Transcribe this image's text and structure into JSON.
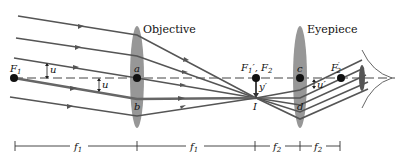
{
  "diagram": {
    "labels": {
      "objective": "Objective",
      "eyepiece": "Eyepiece",
      "F1": "F",
      "F1_sub": "1",
      "a": "a",
      "b": "b",
      "u_top": "u",
      "u_bottom": "u",
      "F1prime_F2": "F",
      "F1prime_sub": "1",
      "F1prime_comma": "′, F",
      "F2_sub": "2",
      "y_prime": "y′",
      "I": "I",
      "c": "c",
      "d": "d",
      "u_prime": "u′",
      "F2prime": "F",
      "F2prime_sub": "2",
      "F2prime_mark": "′"
    },
    "dimensions": [
      {
        "label": "f",
        "sub": "1"
      },
      {
        "label": "f",
        "sub": "1"
      },
      {
        "label": "f",
        "sub": "2"
      },
      {
        "label": "f",
        "sub": "2"
      }
    ],
    "points": {
      "F1": [
        14,
        78
      ],
      "a": [
        137,
        78
      ],
      "b": [
        137,
        105
      ],
      "F1prime_F2": [
        256,
        78
      ],
      "I": [
        256,
        98
      ],
      "c": [
        300,
        78
      ],
      "d": [
        300,
        105
      ],
      "F2prime": [
        341,
        78
      ]
    },
    "colors": {
      "ray": "#555555",
      "lens": "#8c8c8c",
      "dot": "#111111",
      "text": "#111111"
    }
  }
}
